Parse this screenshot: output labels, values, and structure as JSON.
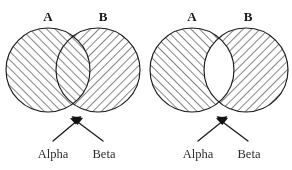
{
  "figure": {
    "canvas": {
      "width": 292,
      "height": 170,
      "background": "#ffffff"
    },
    "ink_color": "#1b1b1b",
    "hatch_color": "#2a2a2a",
    "label_color": "#1a1a1a"
  },
  "diagrams": [
    {
      "id": "left-diagram",
      "name": "intersection-shaded-venn",
      "description": "Two heavily overlapping circles, both fully hatched so the lens-shaped intersection shows cross-hatching",
      "circle_a": {
        "label": "A",
        "cx": 48,
        "cy": 70,
        "r": 42,
        "hatch": "forward",
        "label_x": 48,
        "label_y": 21
      },
      "circle_b": {
        "label": "B",
        "cx": 98,
        "cy": 70,
        "r": 42,
        "hatch": "backward",
        "label_x": 103,
        "label_y": 21
      },
      "intersection": {
        "fill": "cross-hatched",
        "shaded": true
      },
      "callouts": [
        {
          "label": "Alpha",
          "label_x": 53,
          "label_y": 155,
          "tail_x": 53,
          "tail_y": 141,
          "tip_x": 81,
          "tip_y": 117
        },
        {
          "label": "Beta",
          "label_x": 103,
          "label_y": 155,
          "tail_x": 103,
          "tail_y": 141,
          "tip_x": 72,
          "tip_y": 117
        }
      ]
    },
    {
      "id": "right-diagram",
      "name": "intersection-blank-venn",
      "description": "Two circles with a narrow overlap, each hatched but the lens-shaped intersection left blank white",
      "circle_a": {
        "label": "A",
        "cx": 192,
        "cy": 70,
        "r": 42,
        "hatch": "forward",
        "label_x": 192,
        "label_y": 21
      },
      "circle_b": {
        "label": "B",
        "cx": 246,
        "cy": 70,
        "r": 42,
        "hatch": "backward",
        "label_x": 248,
        "label_y": 21
      },
      "intersection": {
        "fill": "blank",
        "shaded": false
      },
      "callouts": [
        {
          "label": "Alpha",
          "label_x": 198,
          "label_y": 155,
          "tail_x": 198,
          "tail_y": 141,
          "tip_x": 227,
          "tip_y": 117
        },
        {
          "label": "Beta",
          "label_x": 248,
          "label_y": 155,
          "tail_x": 248,
          "tail_y": 141,
          "tip_x": 217,
          "tip_y": 117
        }
      ]
    }
  ]
}
